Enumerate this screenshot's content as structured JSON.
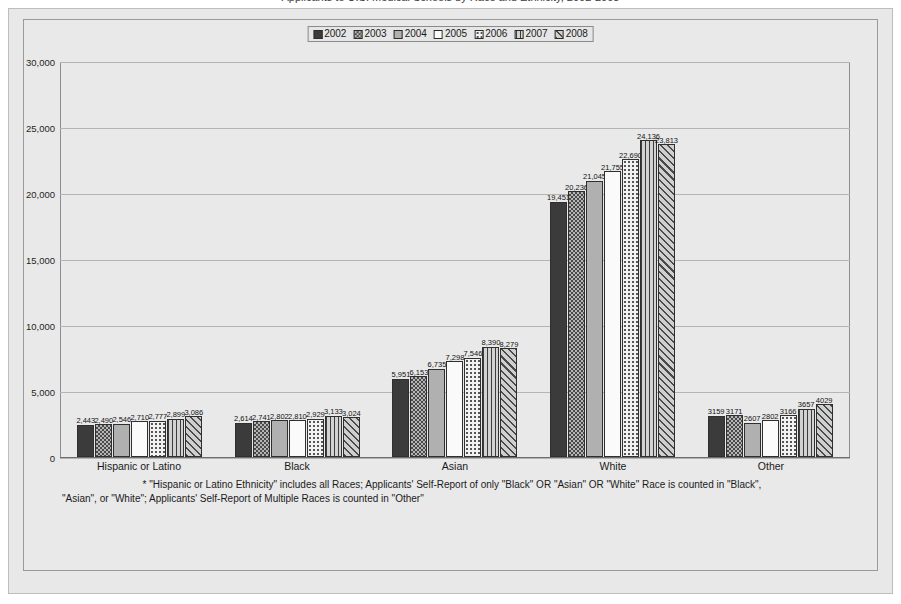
{
  "title": "Applicants to U.S. Medical Schools by Race and Ethnicity, 2002-2008",
  "legend": {
    "items": [
      {
        "label": "2002",
        "pattern": "solid-dark"
      },
      {
        "label": "2003",
        "pattern": "checkerboard"
      },
      {
        "label": "2004",
        "pattern": "solid-gray"
      },
      {
        "label": "2005",
        "pattern": "solid-white"
      },
      {
        "label": "2006",
        "pattern": "dotted"
      },
      {
        "label": "2007",
        "pattern": "vertical-lines"
      },
      {
        "label": "2008",
        "pattern": "diagonal-hatch"
      }
    ]
  },
  "yaxis": {
    "ticks": [
      "30,000",
      "25,000",
      "20,000",
      "15,000",
      "10,000",
      "5,000",
      "0"
    ]
  },
  "footnote": {
    "line1": "* \"Hispanic or Latino Ethnicity\" includes all Races; Applicants' Self-Report of only \"Black\" OR \"Asian\" OR \"White\" Race is counted in \"Black\",",
    "line2": "\"Asian\", or \"White\"; Applicants' Self-Report of Multiple Races is counted in \"Other\""
  },
  "chart_data": {
    "type": "bar",
    "title": "Applicants to U.S. Medical Schools by Race and Ethnicity, 2002-2008",
    "xlabel": "",
    "ylabel": "",
    "ylim": [
      0,
      30000
    ],
    "ytick_values": [
      0,
      5000,
      10000,
      15000,
      20000,
      25000,
      30000
    ],
    "grid": true,
    "legend_position": "top-center",
    "categories": [
      "Hispanic or Latino",
      "Black",
      "Asian",
      "White",
      "Other"
    ],
    "series": [
      {
        "name": "2002",
        "values": [
          2443,
          2614,
          5951,
          19451,
          3159
        ],
        "labels": [
          "2,443",
          "2,614",
          "5,951",
          "19,451",
          "3159"
        ]
      },
      {
        "name": "2003",
        "values": [
          2490,
          2741,
          6153,
          20236,
          3171
        ],
        "labels": [
          "2,490",
          "2,741",
          "6,153",
          "20,236",
          "3171"
        ]
      },
      {
        "name": "2004",
        "values": [
          2546,
          2802,
          6735,
          21045,
          2607
        ],
        "labels": [
          "2,546",
          "2,802",
          "6,735",
          "21,045",
          "2607"
        ]
      },
      {
        "name": "2005",
        "values": [
          2710,
          2810,
          7298,
          21755,
          2802
        ],
        "labels": [
          "2,710",
          "2,810",
          "7,298",
          "21,755",
          "2802"
        ]
      },
      {
        "name": "2006",
        "values": [
          2777,
          2929,
          7546,
          22690,
          3166
        ],
        "labels": [
          "2,777",
          "2,929",
          "7,546",
          "22,690",
          "3166"
        ]
      },
      {
        "name": "2007",
        "values": [
          2899,
          3133,
          8390,
          24136,
          3657
        ],
        "labels": [
          "2,899",
          "3,133",
          "8,390",
          "24,136",
          "3657"
        ]
      },
      {
        "name": "2008",
        "values": [
          3086,
          3024,
          8279,
          23813,
          4029
        ],
        "labels": [
          "3,086",
          "3,024",
          "8,279",
          "23,813",
          "4029"
        ]
      }
    ]
  }
}
